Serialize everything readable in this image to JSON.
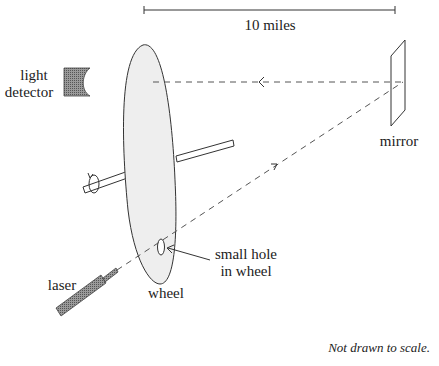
{
  "diagram": {
    "scale_bar": {
      "label": "10 miles"
    },
    "labels": {
      "light_detector_line1": "light",
      "light_detector_line2": "detector",
      "mirror": "mirror",
      "laser": "laser",
      "wheel": "wheel",
      "hole_line1": "small hole",
      "hole_line2": "in wheel"
    },
    "note": "Not drawn to scale.",
    "colors": {
      "line": "#333333",
      "wheel_fill": "#eeeeee",
      "device_fill": "#777777",
      "dash": "#555555"
    }
  }
}
